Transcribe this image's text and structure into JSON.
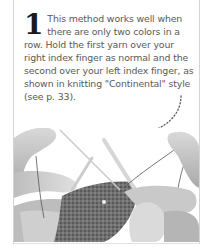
{
  "step": {
    "number": "1",
    "text": "This method works well when there are only two colors in a row. Hold the first yarn over your right index finger as normal and the second over your left index finger, as shown in knitting \"Continental\" style (see p. 33)."
  },
  "illustration": {
    "subject": "Hands knitting with two yarns, one over each index finger",
    "style": "grayscale photo"
  },
  "colors": {
    "border": "#d4d4d4",
    "text": "#5a5a5a",
    "number": "#1a1a1a",
    "arrow": "#555555"
  }
}
